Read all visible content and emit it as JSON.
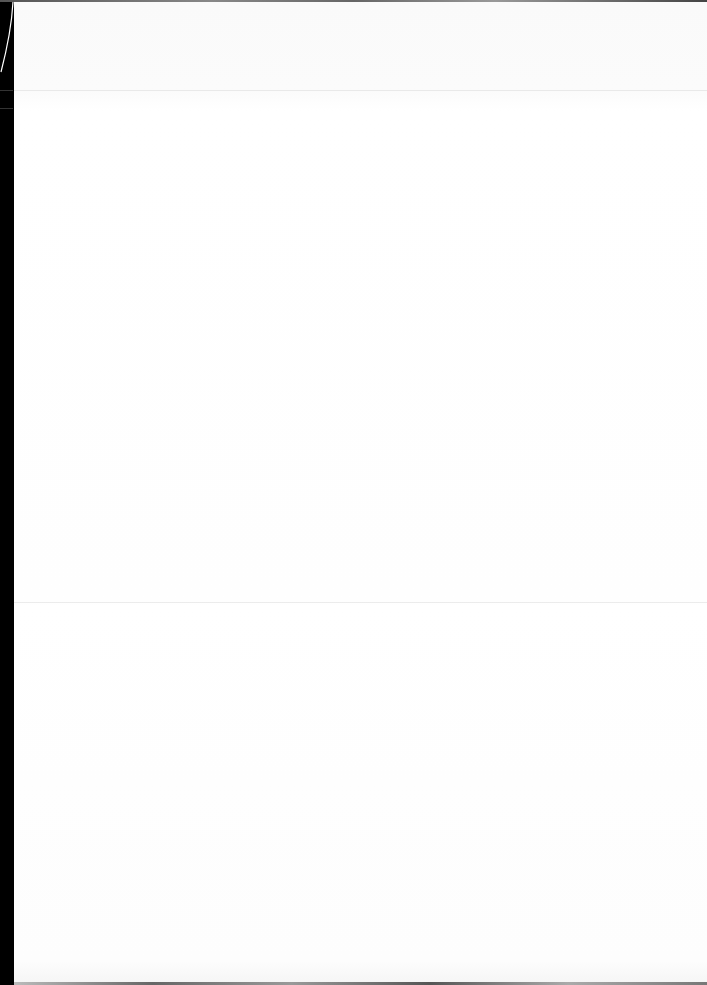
{
  "document": {
    "type": "scanned blank page",
    "content": "",
    "colors": {
      "paper": "#ffffff",
      "scanner_border": "#000000"
    }
  }
}
